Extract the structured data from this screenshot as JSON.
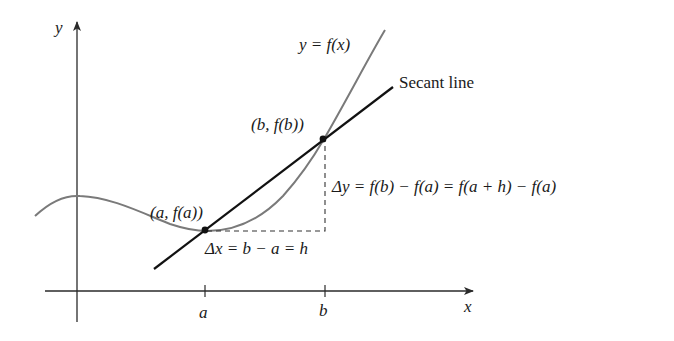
{
  "figure": {
    "axes": {
      "x_label": "x",
      "y_label": "y"
    },
    "ticks": {
      "a_label": "a",
      "b_label": "b"
    },
    "labels": {
      "curve": "y = f(x)",
      "secant": "Secant line",
      "point_a": "(a, f(a))",
      "point_b": "(b, f(b))",
      "delta_x": "Δx = b − a = h",
      "delta_y": "Δy = f(b) − f(a) = f(a + h) − f(a)"
    },
    "colors": {
      "curve": "#7a7a7a",
      "secant": "#111111",
      "axes": "#2a2a2a"
    }
  }
}
